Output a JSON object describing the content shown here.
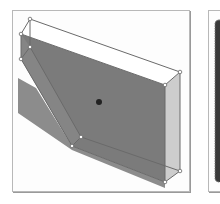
{
  "figure": {
    "panels": [
      {
        "id": "left",
        "description": "3D slab with chamfered edge, selected with vertex handles, showing drop shadow",
        "colors": {
          "front_face": "#7a7a7a",
          "side_face": "#c8c8c8",
          "top_face": "#ffffff",
          "shadow": "#8a8a8a",
          "edge": "#6b6b6b",
          "center_dot": "#222222"
        }
      },
      {
        "id": "right",
        "description": "Partial view of a textured dark object",
        "colors": {
          "fill": "#3a3a3a"
        }
      }
    ]
  }
}
